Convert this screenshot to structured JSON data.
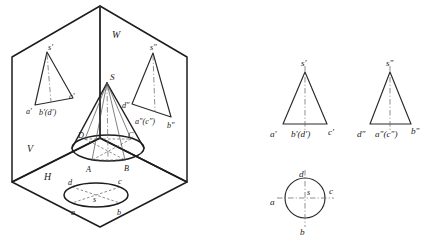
{
  "figure": {
    "kind": "orthographic-projection-diagram",
    "stroke_color": "#1d1d1d",
    "background_color": "#ffffff"
  },
  "pictorial": {
    "name": "three-plane projection box",
    "plane_labels": {
      "frontal": "V",
      "horizontal": "H",
      "profile": "W"
    },
    "solid": {
      "apex_label": "S",
      "base_labels": [
        "A",
        "B",
        "C",
        "D"
      ]
    },
    "frontal_projection": {
      "apex_label": "s'",
      "base_labels": [
        "a'",
        "b'(d')",
        "c'"
      ]
    },
    "profile_projection": {
      "apex_label": "s\"",
      "base_labels": [
        "d\"",
        "a\"(c\")",
        "b\""
      ]
    },
    "horizontal_projection": {
      "center_label": "s",
      "base_labels": [
        "a",
        "b",
        "c",
        "d"
      ]
    }
  },
  "orthographic": {
    "front_view": {
      "name": "front view",
      "apex_label": "s'",
      "left_label": "a'",
      "center_label": "b'(d')",
      "right_label": "c'"
    },
    "side_view": {
      "name": "side view",
      "apex_label": "s\"",
      "left_label": "d\"",
      "center_label": "a\"(c\")",
      "right_label": "b\""
    },
    "top_view": {
      "name": "top view",
      "center_label": "s",
      "top_label": "d",
      "bottom_label": "b",
      "left_label": "a",
      "right_label": "c"
    }
  },
  "caption": {
    "text": ""
  }
}
